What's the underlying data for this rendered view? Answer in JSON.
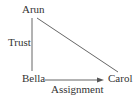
{
  "diagram": {
    "nodes": [
      {
        "id": "arun",
        "label": "Arun"
      },
      {
        "id": "bella",
        "label": "Bella"
      },
      {
        "id": "carol",
        "label": "Carol"
      }
    ],
    "edges": [
      {
        "from": "arun",
        "to": "bella",
        "label": "Trust",
        "directed": false
      },
      {
        "from": "arun",
        "to": "carol",
        "label": "",
        "directed": false
      },
      {
        "from": "bella",
        "to": "carol",
        "label": "Assignment",
        "directed": true
      }
    ],
    "colors": {
      "line": "#555555",
      "text": "#333333",
      "background": "#ffffff"
    }
  }
}
